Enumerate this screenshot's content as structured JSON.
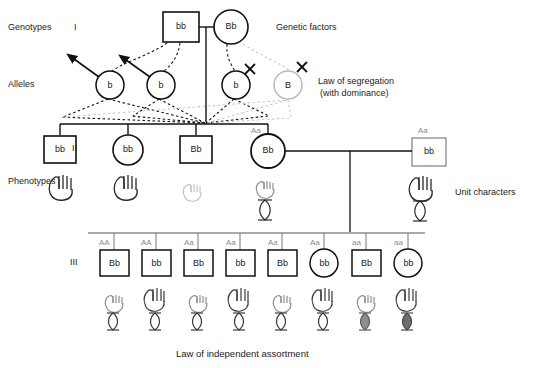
{
  "figure": {
    "title_bottom": "Law of independent assortment",
    "row_labels": [
      {
        "name": "genotypes",
        "text": "Genotypes"
      },
      {
        "name": "alleles",
        "text": "Alleles"
      },
      {
        "name": "phenotypes",
        "text": "Phenotypes"
      }
    ],
    "generation_labels": [
      "I",
      "II",
      "III"
    ],
    "annotations": [
      {
        "name": "genetic-factors",
        "text": "Genetic factors"
      },
      {
        "name": "law-of-segregation-line1",
        "text": "Law of segregation"
      },
      {
        "name": "law-of-segregation-line2",
        "text": "(with dominance)"
      },
      {
        "name": "unit-characters",
        "text": "Unit characters"
      }
    ],
    "colors": {
      "stroke_dark": "#111111",
      "stroke_light": "#b5b5b5",
      "genotype_gray": "#8c8c8c",
      "eye_fill_light": "#ffffff",
      "eye_fill_mid": "#8e8e8e",
      "eye_fill_dark": "#6e6e6e",
      "background": "#ffffff"
    }
  },
  "generation_1": {
    "label": "I",
    "individuals": [
      {
        "name": "gen1-father",
        "shape": "square",
        "genotype": "bb",
        "sex": "male"
      },
      {
        "name": "gen1-mother",
        "shape": "circle",
        "genotype": "Bb",
        "sex": "female"
      }
    ]
  },
  "alleles_row": {
    "label": "Alleles",
    "gametes": [
      {
        "name": "allele-b-1",
        "letter": "b",
        "marker": "arrow"
      },
      {
        "name": "allele-b-2",
        "letter": "b",
        "marker": "arrow"
      },
      {
        "name": "allele-b-3",
        "letter": "b",
        "marker": "cross"
      },
      {
        "name": "allele-B-4",
        "letter": "B",
        "marker": "cross"
      }
    ]
  },
  "generation_2": {
    "label": "II",
    "individuals": [
      {
        "name": "gen2-child-1",
        "shape": "square",
        "genotype": "bb",
        "upper_genotype": "",
        "hand": "dark-tall",
        "eye": "none"
      },
      {
        "name": "gen2-child-2",
        "shape": "circle",
        "genotype": "bb",
        "upper_genotype": "",
        "hand": "dark-tall",
        "eye": "none"
      },
      {
        "name": "gen2-child-3",
        "shape": "square",
        "genotype": "Bb",
        "upper_genotype": "",
        "hand": "light-short",
        "eye": "none"
      },
      {
        "name": "gen2-child-4",
        "shape": "circle",
        "genotype": "Bb",
        "upper_genotype": "Aa",
        "hand": "light-short",
        "eye": "open"
      },
      {
        "name": "gen2-spouse",
        "shape": "square",
        "genotype": "bb",
        "upper_genotype": "Aa",
        "hand": "dark-tall",
        "eye": "open"
      }
    ]
  },
  "generation_3": {
    "label": "III",
    "individuals": [
      {
        "name": "gen3-child-1",
        "shape": "square",
        "genotype": "Bb",
        "upper_genotype": "AA",
        "hand": "light-short",
        "eye": "open"
      },
      {
        "name": "gen3-child-2",
        "shape": "square",
        "genotype": "bb",
        "upper_genotype": "AA",
        "hand": "dark-tall",
        "eye": "open"
      },
      {
        "name": "gen3-child-3",
        "shape": "square",
        "genotype": "Bb",
        "upper_genotype": "Aa",
        "hand": "light-short",
        "eye": "open"
      },
      {
        "name": "gen3-child-4",
        "shape": "square",
        "genotype": "bb",
        "upper_genotype": "Aa",
        "hand": "dark-tall",
        "eye": "open"
      },
      {
        "name": "gen3-child-5",
        "shape": "square",
        "genotype": "Bb",
        "upper_genotype": "Aa",
        "hand": "light-short",
        "eye": "open"
      },
      {
        "name": "gen3-child-6",
        "shape": "circle",
        "genotype": "bb",
        "upper_genotype": "Aa",
        "hand": "dark-tall",
        "eye": "open"
      },
      {
        "name": "gen3-child-7",
        "shape": "square",
        "genotype": "Bb",
        "upper_genotype": "aa",
        "hand": "light-short",
        "eye": "filled-mid"
      },
      {
        "name": "gen3-child-8",
        "shape": "circle",
        "genotype": "bb",
        "upper_genotype": "aa",
        "hand": "dark-tall",
        "eye": "filled-dark"
      }
    ]
  }
}
